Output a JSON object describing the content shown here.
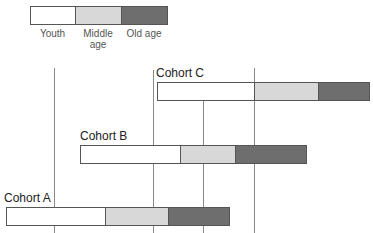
{
  "legend": {
    "items": [
      {
        "label": "Youth",
        "color": "#ffffff"
      },
      {
        "label": "Middle age",
        "label_line1": "Middle",
        "label_line2": "age",
        "color": "#d8d8d8"
      },
      {
        "label": "Old age",
        "color": "#6e6e6e"
      }
    ]
  },
  "cohorts": [
    {
      "name": "Cohort C",
      "youth": [
        157,
        254
      ],
      "middle": [
        254,
        318
      ],
      "old": [
        318,
        370
      ]
    },
    {
      "name": "Cohort B",
      "youth": [
        80,
        180
      ],
      "middle": [
        180,
        235
      ],
      "old": [
        235,
        307
      ]
    },
    {
      "name": "Cohort A",
      "youth": [
        6,
        105
      ],
      "middle": [
        105,
        168
      ],
      "old": [
        168,
        230
      ]
    }
  ],
  "reference_lines_x": [
    54,
    153,
    203,
    254
  ]
}
